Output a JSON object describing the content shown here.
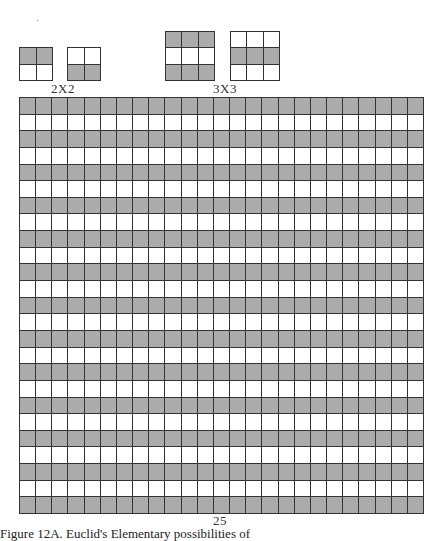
{
  "figure": {
    "small_examples": [
      {
        "label": "2X2",
        "size": 2,
        "patterns": [
          {
            "rows": [
              [
                1,
                1
              ],
              [
                0,
                0
              ]
            ]
          },
          {
            "rows": [
              [
                0,
                0
              ],
              [
                1,
                1
              ]
            ]
          }
        ]
      },
      {
        "label": "3X3",
        "size": 3,
        "patterns": [
          {
            "rows": [
              [
                1,
                1,
                1
              ],
              [
                0,
                0,
                0
              ],
              [
                1,
                1,
                1
              ]
            ]
          },
          {
            "rows": [
              [
                0,
                0,
                0
              ],
              [
                1,
                1,
                1
              ],
              [
                0,
                0,
                0
              ]
            ]
          }
        ]
      }
    ],
    "large_grid": {
      "label": "25",
      "size": 25,
      "pattern": "alternating horizontal rows, first row shaded"
    },
    "caption": "Figure 12A. Euclid's Elementary possibilities of"
  },
  "colors": {
    "shaded": "#ababab",
    "unshaded": "#ffffff",
    "lines": "#333333"
  }
}
